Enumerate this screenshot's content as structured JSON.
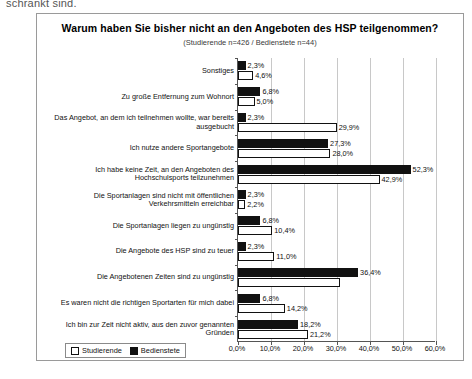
{
  "page": {
    "top_text_fragment": "schränkt sind."
  },
  "legend": {
    "studierende_label": "Studierende",
    "bedienstete_label": "Bedienstete"
  },
  "colors": {
    "studierende": "#ffffff",
    "bedienstete": "#111111",
    "frame": "#9a9a9a",
    "grid": "#c8c8c8",
    "axis": "#555555"
  },
  "chart_data": {
    "type": "bar",
    "orientation": "horizontal",
    "title": "Warum haben Sie bisher nicht an den Angeboten des HSP teilgenommen?",
    "subtitle": "(Studierende n=426 / Bedienstete n=44)",
    "xlabel": "",
    "ylabel": "",
    "xlim": [
      0,
      60
    ],
    "grid": true,
    "legend_position": "bottom-left",
    "tick_labels": [
      "0,0%",
      "10,0%",
      "20,0%",
      "30,0%",
      "40,0%",
      "50,0%",
      "60,0%"
    ],
    "tick_values": [
      0,
      10,
      20,
      30,
      40,
      50,
      60
    ],
    "categories": [
      "Sonstiges",
      "Zu große Entfernung zum Wohnort",
      "Das Angebot, an dem ich teilnehmen wollte, war bereits ausgebucht",
      "Ich nutze andere Sportangebote",
      "Ich habe keine Zeit, an den Angeboten des Hochschulsports teilzunehmen",
      "Die Sportanlagen sind nicht mit öffentlichen Verkehrsmitteln erreichbar",
      "Die Sportanlagen liegen zu ungünstig",
      "Die Angebote des HSP sind zu teuer",
      "Die Angebotenen Zeiten sind zu ungünstig",
      "Es waren nicht die richtigen Sportarten für mich dabei",
      "Ich bin zur Zeit nicht aktiv, aus den zuvor genannten Gründen"
    ],
    "series": [
      {
        "name": "Bedienstete",
        "color": "#111111",
        "values": [
          2.3,
          6.8,
          2.3,
          27.3,
          52.3,
          2.3,
          6.8,
          2.3,
          36.4,
          6.8,
          18.2
        ],
        "labels": [
          "2,3%",
          "6,8%",
          "2,3%",
          "27,3%",
          "52,3%",
          "2,3%",
          "6,8%",
          "2,3%",
          "36,4%",
          "6,8%",
          "18,2%"
        ]
      },
      {
        "name": "Studierende",
        "color": "#ffffff",
        "values": [
          4.6,
          5.0,
          29.9,
          28.0,
          42.9,
          2.2,
          10.4,
          11.0,
          30.9,
          14.2,
          21.2
        ],
        "labels": [
          "4,6%",
          "5,0%",
          "29,9%",
          "28,0%",
          "42,9%",
          "2,2%",
          "10,4%",
          "11,0%",
          "",
          "14,2%",
          "21,2%"
        ]
      }
    ]
  }
}
